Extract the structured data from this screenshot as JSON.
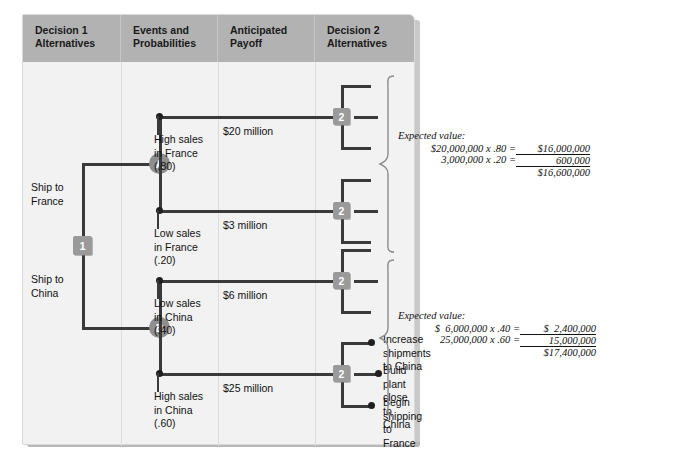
{
  "diagram": {
    "colors": {
      "header_gray": "#b2b2b2",
      "panel_bg": "#f2f2f2",
      "node_gray": "#9a9a9a",
      "circle_gray": "#8f8f8f",
      "line_dark": "#3a3a3a"
    },
    "columns": [
      {
        "label": "Decision 1\nAlternatives"
      },
      {
        "label": "Events and\nProbabilities"
      },
      {
        "label": "Anticipated\nPayoff"
      },
      {
        "label": "Decision 2\nAlternatives"
      }
    ],
    "nodes": {
      "decision1": "1",
      "chance_a": "A",
      "chance_b": "B",
      "decision2": "2"
    },
    "decision1_alternatives": [
      {
        "label": "Ship to\nFrance"
      },
      {
        "label": "Ship to\nChina"
      }
    ],
    "events": [
      {
        "label": "High sales\nin France",
        "probability": "(.80)"
      },
      {
        "label": "Low sales\nin France",
        "probability": "(.20)"
      },
      {
        "label": "Low sales\nin China",
        "probability": "(.40)"
      },
      {
        "label": "High sales\nin China",
        "probability": "(.60)"
      }
    ],
    "payoffs": [
      {
        "value": "$20 million"
      },
      {
        "value": "$3 million"
      },
      {
        "value": "$6 million"
      },
      {
        "value": "$25 million"
      }
    ],
    "decision2_alternatives": [
      {
        "label": "Increase shipments\nto China"
      },
      {
        "label": "Build plant\nclose to China"
      },
      {
        "label": "Begin shipping\nto France"
      }
    ],
    "expected_values": [
      {
        "title": "Expected value:",
        "rows": [
          {
            "left": "$20,000,000 x .80 =",
            "right": "$16,000,000"
          },
          {
            "left": "3,000,000 x .20 =",
            "right": "600,000"
          }
        ],
        "total": "$16,600,000"
      },
      {
        "title": "Expected value:",
        "rows": [
          {
            "left": "$  6,000,000 x .40 =",
            "right": "$  2,400,000"
          },
          {
            "left": "25,000,000 x .60 =",
            "right": "15,000,000"
          }
        ],
        "total": "$17,400,000"
      }
    ]
  }
}
